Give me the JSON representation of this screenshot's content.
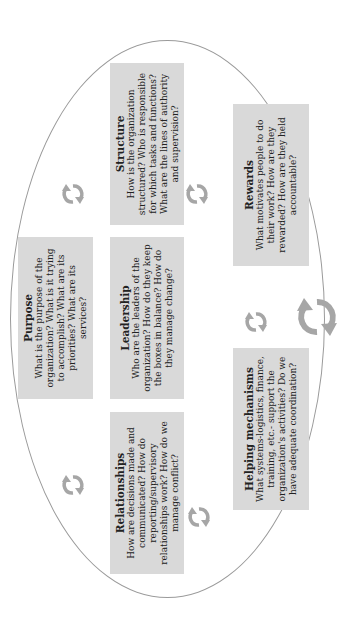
{
  "diagram": {
    "orientation": "rotated-90-ccw",
    "boxes": [
      {
        "id": "purpose",
        "title": "Purpose",
        "text": "What is the purpose of the organization? What is it trying to accomplish? What are its priorities? What are its services?"
      },
      {
        "id": "structure",
        "title": "Structure",
        "text": "How is the organization structured? Who is responsible for which tasks and functions? What are the lines of authority and supervision?"
      },
      {
        "id": "leadership",
        "title": "Leadership",
        "text": "Who are the leaders of the organization? How do they keep the boxes in balance? How do they manage change?"
      },
      {
        "id": "relationships",
        "title": "Relationships",
        "text": "How are decisions made and communicated? How do reporting/supervisory relationships work? How do we manage conflict?"
      },
      {
        "id": "rewards",
        "title": "Rewards",
        "text": "What motivates people to do their work? How are they rewarded? How are they held accountable?"
      },
      {
        "id": "helping",
        "title": "Helping mechanisms",
        "text": "What systems-logistics, finance, training, etc.- support the organization's activities? Do we have adequate coordination?"
      }
    ],
    "icons": [
      "cycle-arrows-icon",
      "cycle-arrows-icon",
      "cycle-arrows-icon",
      "cycle-arrows-icon",
      "cycle-arrows-icon",
      "large-cycle-arrows-icon"
    ],
    "colors": {
      "box_fill": "#d9d9d9",
      "arrow": "#a6a6a6",
      "ellipse": "#9a9a9a"
    }
  }
}
